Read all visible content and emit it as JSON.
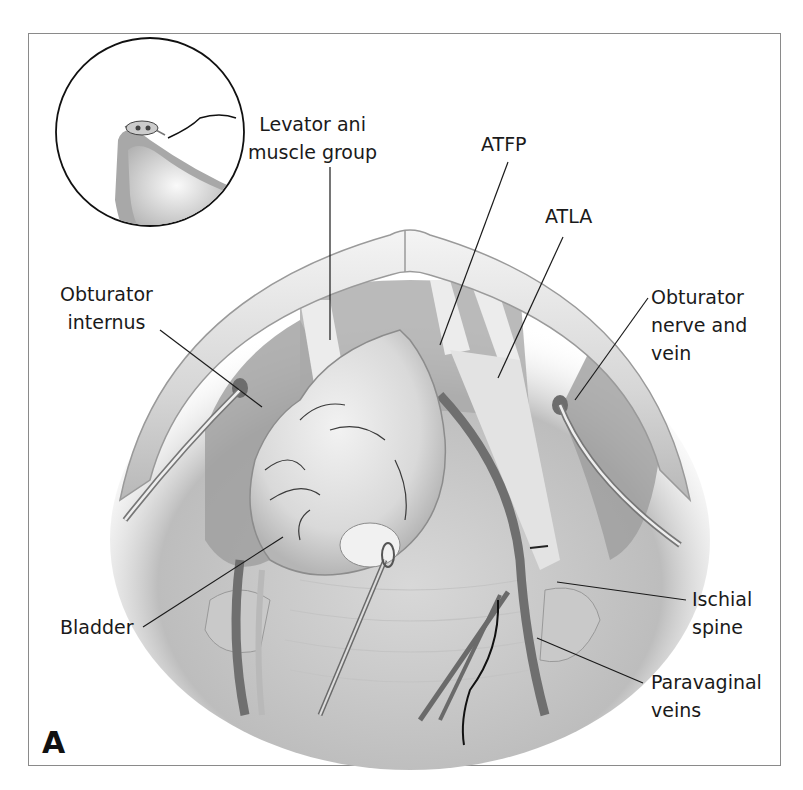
{
  "figure": {
    "panel_letter": "A",
    "labels": {
      "levator_ani": "Levator ani\nmuscle group",
      "atfp": "ATFP",
      "atla": "ATLA",
      "obturator_internus": "Obturator\ninternus",
      "obturator_nerve": "Obturator\nnerve and\nvein",
      "bladder": "Bladder",
      "ischial_spine": "Ischial\nspine",
      "paravaginal_veins": "Paravaginal\nveins"
    },
    "colors": {
      "frame_border": "#8a8a8a",
      "ink": "#1a1a1a",
      "tissue_light": "#e6e6e6",
      "tissue_mid": "#bdbdbd",
      "tissue_dark": "#8e8e8e"
    }
  }
}
